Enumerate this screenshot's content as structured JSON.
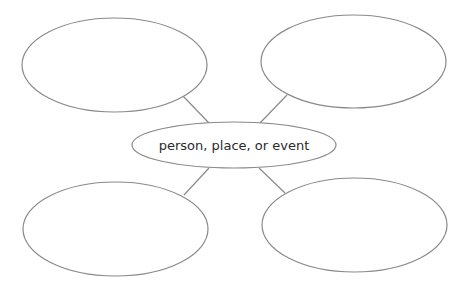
{
  "diagram": {
    "type": "concept-web",
    "center": {
      "label": "person, place, or event"
    },
    "branches": [
      {
        "position": "top-left",
        "label": ""
      },
      {
        "position": "top-right",
        "label": ""
      },
      {
        "position": "bottom-left",
        "label": ""
      },
      {
        "position": "bottom-right",
        "label": ""
      }
    ],
    "colors": {
      "stroke": "#8a8a8a",
      "text": "#2a2a2a",
      "background": "#ffffff"
    }
  }
}
